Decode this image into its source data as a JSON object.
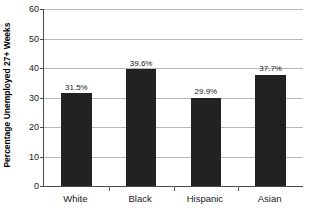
{
  "chart_data": {
    "type": "bar",
    "title": "",
    "xlabel": "",
    "ylabel": "Percentage Unemployed 27+ Weeks",
    "categories": [
      "White",
      "Black",
      "Hispanic",
      "Asian"
    ],
    "values": [
      31.5,
      39.6,
      29.9,
      37.7
    ],
    "value_labels": [
      "31.5%",
      "39.6%",
      "29.9%",
      "37.7%"
    ],
    "ylim": [
      0,
      60
    ],
    "ytick_step": 10,
    "yticks": [
      0,
      10,
      20,
      30,
      40,
      50,
      60
    ],
    "ytick_labels": [
      "0",
      "10",
      "20",
      "30",
      "40",
      "50",
      "60"
    ],
    "grid": true,
    "grid_axis": "y",
    "legend": false,
    "bar_color": "#222222",
    "gridline_color": "#b7b7b7",
    "axis_color": "#4a4a4a",
    "background_color": "#ffffff"
  }
}
